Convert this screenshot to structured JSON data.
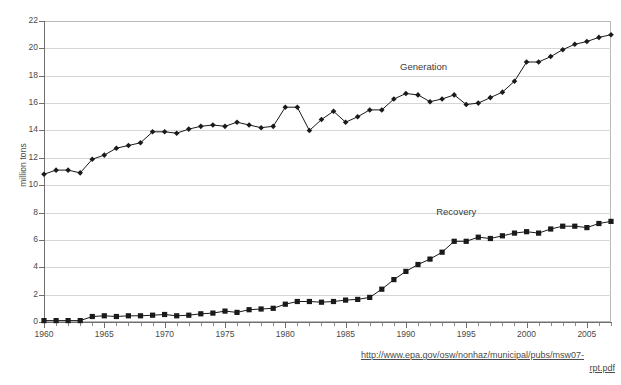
{
  "figure": {
    "cut_off_title": "Municipal Solid Waste Generation and Recovery",
    "source_url_line1": "http://www.epa.gov/osw/nonhaz/municipal/pubs/msw07-",
    "source_url_line2": "rpt.pdf",
    "colors": {
      "line": "#1a1a1a",
      "grid": "#d6d6d6",
      "axis": "#6f6f6f",
      "text": "#4a4a4a",
      "background": "#ffffff"
    }
  },
  "chart_data": {
    "type": "line",
    "title": "",
    "xlabel": "",
    "ylabel": "million tons",
    "xlim": [
      1960,
      2007
    ],
    "ylim": [
      0,
      22
    ],
    "ytick_labels": [
      "0",
      "2",
      "4",
      "6",
      "8",
      "10",
      "12",
      "14",
      "16",
      "18",
      "20",
      "22"
    ],
    "ytick_values": [
      0,
      2,
      4,
      6,
      8,
      10,
      12,
      14,
      16,
      18,
      20,
      22
    ],
    "xtick_labels": [
      "1960",
      "1965",
      "1970",
      "1975",
      "1980",
      "1985",
      "1990",
      "1995",
      "2000",
      "2005"
    ],
    "xtick_values": [
      1960,
      1965,
      1970,
      1975,
      1980,
      1985,
      1990,
      1995,
      2000,
      2005
    ],
    "grid": "horizontal",
    "legend_position": "inline-annotations",
    "x": [
      1960,
      1961,
      1962,
      1963,
      1964,
      1965,
      1966,
      1967,
      1968,
      1969,
      1970,
      1971,
      1972,
      1973,
      1974,
      1975,
      1976,
      1977,
      1978,
      1979,
      1980,
      1981,
      1982,
      1983,
      1984,
      1985,
      1986,
      1987,
      1988,
      1989,
      1990,
      1991,
      1992,
      1993,
      1994,
      1995,
      1996,
      1997,
      1998,
      1999,
      2000,
      2001,
      2002,
      2003,
      2004,
      2005,
      2006,
      2007
    ],
    "series": [
      {
        "name": "Generation",
        "marker": "diamond",
        "label_text": "Generation",
        "values": [
          10.8,
          11.1,
          11.1,
          10.9,
          11.9,
          12.2,
          12.7,
          12.9,
          13.1,
          13.9,
          13.9,
          13.8,
          14.1,
          14.3,
          14.4,
          14.3,
          14.6,
          14.4,
          14.2,
          14.3,
          15.7,
          15.7,
          14.0,
          14.8,
          15.4,
          14.6,
          15.0,
          15.5,
          15.5,
          16.3,
          16.7,
          16.6,
          16.1,
          16.3,
          16.6,
          15.9,
          16.0,
          16.4,
          16.8,
          17.6,
          19.0,
          19.0,
          19.4,
          19.9,
          20.3,
          20.5,
          20.8,
          21.0
        ]
      },
      {
        "name": "Recovery",
        "marker": "square",
        "label_text": "Recovery",
        "values": [
          0.1,
          0.1,
          0.1,
          0.1,
          0.4,
          0.45,
          0.4,
          0.45,
          0.45,
          0.5,
          0.55,
          0.45,
          0.5,
          0.6,
          0.65,
          0.8,
          0.7,
          0.9,
          0.95,
          1.0,
          1.3,
          1.5,
          1.5,
          1.45,
          1.5,
          1.6,
          1.65,
          1.8,
          2.4,
          3.1,
          3.7,
          4.2,
          4.6,
          5.1,
          5.9,
          5.9,
          6.2,
          6.1,
          6.3,
          6.5,
          6.6,
          6.5,
          6.8,
          7.0,
          7.0,
          6.9,
          7.2,
          7.35
        ]
      }
    ],
    "annotations": [
      {
        "text": "Generation",
        "x": 1992,
        "y": 18.6
      },
      {
        "text": "Recovery",
        "x": 1995,
        "y": 8.0
      }
    ]
  }
}
